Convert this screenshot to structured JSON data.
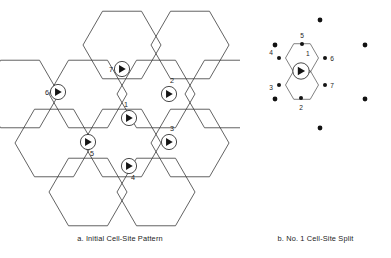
{
  "figure": {
    "background_color": "#ffffff",
    "line_color": "#3b3b3b",
    "marker_color": "#141414"
  },
  "panel_a": {
    "caption": "a.  Initial Cell-Site Pattern",
    "marker_type": "circle-with-right-triangle",
    "sites": [
      {
        "id": "1",
        "label": "1",
        "cx": 129,
        "cy": 118,
        "label_x": 126,
        "label_y": 107,
        "label_anchor": "middle"
      },
      {
        "id": "2",
        "label": "2",
        "cx": 169,
        "cy": 94,
        "label_x": 172,
        "label_y": 83,
        "label_anchor": "middle"
      },
      {
        "id": "3",
        "label": "3",
        "cx": 169,
        "cy": 142,
        "label_x": 172,
        "label_y": 131,
        "label_anchor": "middle"
      },
      {
        "id": "4",
        "label": "4",
        "cx": 129,
        "cy": 166,
        "label_x": 133,
        "label_y": 180,
        "label_anchor": "middle"
      },
      {
        "id": "5",
        "label": "5",
        "cx": 88,
        "cy": 142,
        "label_x": 92,
        "label_y": 156,
        "label_anchor": "middle"
      },
      {
        "id": "6",
        "label": "6",
        "cx": 58,
        "cy": 92,
        "label_x": 47,
        "label_y": 95,
        "label_anchor": "middle"
      },
      {
        "id": "7",
        "label": "7",
        "cx": 122,
        "cy": 69,
        "label_x": 111,
        "label_y": 72,
        "label_anchor": "middle"
      }
    ],
    "hexagons": [
      {
        "name": "hex-top-center",
        "cx": 122,
        "cy": 45
      },
      {
        "name": "hex-top-right",
        "cx": 190,
        "cy": 45
      },
      {
        "name": "hex-upper-left",
        "cx": 88,
        "cy": 94
      },
      {
        "name": "hex-upper-center",
        "cx": 156,
        "cy": 94
      },
      {
        "name": "hex-left",
        "cx": 54,
        "cy": 143
      },
      {
        "name": "hex-center",
        "cx": 122,
        "cy": 143
      },
      {
        "name": "hex-right",
        "cx": 190,
        "cy": 143
      },
      {
        "name": "hex-lower-left",
        "cx": 88,
        "cy": 192
      },
      {
        "name": "hex-lower-center",
        "cx": 156,
        "cy": 192
      },
      {
        "name": "hex-far-upper-left",
        "cx": 20,
        "cy": 94
      },
      {
        "name": "hex-far-right-upper",
        "cx": 224,
        "cy": 94
      }
    ],
    "hex_radius": 39
  },
  "panel_b": {
    "caption": "b.  No. 1 Cell-Site Split",
    "site_marker": {
      "cx": 61,
      "cy": 71,
      "label": ""
    },
    "vertices": [
      {
        "id": "1",
        "label": "1",
        "x": 62,
        "y": 62,
        "label_x": 66,
        "label_y": 56,
        "anchor": "start",
        "show_dot": false
      },
      {
        "id": "2",
        "label": "2",
        "x": 61,
        "y": 98,
        "label_x": 61,
        "label_y": 110,
        "anchor": "middle",
        "show_dot": true
      },
      {
        "id": "3",
        "label": "3",
        "x": 39,
        "y": 85,
        "label_x": 31,
        "label_y": 90,
        "anchor": "middle",
        "show_dot": true
      },
      {
        "id": "4",
        "label": "4",
        "x": 39,
        "y": 58,
        "label_x": 31,
        "label_y": 55,
        "anchor": "middle",
        "show_dot": true
      },
      {
        "id": "5",
        "label": "5",
        "x": 62,
        "y": 44,
        "label_x": 62,
        "label_y": 38,
        "anchor": "middle",
        "show_dot": true
      },
      {
        "id": "6",
        "label": "6",
        "x": 85,
        "y": 58,
        "label_x": 92,
        "label_y": 61,
        "anchor": "middle",
        "show_dot": true
      },
      {
        "id": "7",
        "label": "7",
        "x": 85,
        "y": 85,
        "label_x": 92,
        "label_y": 88,
        "anchor": "middle",
        "show_dot": true
      }
    ],
    "outer_dots": [
      {
        "name": "outer-dot-top",
        "x": 80,
        "y": 20
      },
      {
        "name": "outer-dot-upper-left",
        "x": 35,
        "y": 45
      },
      {
        "name": "outer-dot-upper-right",
        "x": 125,
        "y": 45
      },
      {
        "name": "outer-dot-lower-left",
        "x": 35,
        "y": 99
      },
      {
        "name": "outer-dot-lower-right",
        "x": 125,
        "y": 99
      },
      {
        "name": "outer-dot-bottom",
        "x": 80,
        "y": 128
      }
    ],
    "small_hexagons": [
      {
        "name": "small-hex-upper",
        "cx": 62,
        "cy": 58
      },
      {
        "name": "small-hex-lower",
        "cx": 62,
        "cy": 85
      }
    ]
  }
}
